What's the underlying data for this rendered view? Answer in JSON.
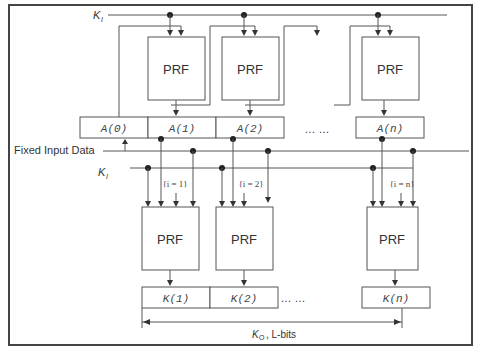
{
  "diagram": {
    "labels": {
      "ki_top": "K",
      "ki_top_sub": "I",
      "ki_mid": "K",
      "ki_mid_sub": "I",
      "fixed_input": "Fixed Input Data",
      "ko": "K",
      "ko_sub": "O",
      "ko_rest": ", L-bits",
      "ellipsis_a": "… …",
      "ellipsis_k": "… …"
    },
    "top_prf": [
      {
        "label": "PRF"
      },
      {
        "label": "PRF"
      },
      {
        "label": "PRF"
      }
    ],
    "a_registers": [
      {
        "label": "A(0)"
      },
      {
        "label": "A(1)"
      },
      {
        "label": "A(2)"
      },
      {
        "label": "A(n)"
      }
    ],
    "counters": [
      {
        "label": "{i = 1}"
      },
      {
        "label": "{i = 2}"
      },
      {
        "label": "{i = n}"
      }
    ],
    "bottom_prf": [
      {
        "label": "PRF"
      },
      {
        "label": "PRF"
      },
      {
        "label": "PRF"
      }
    ],
    "k_outputs": [
      {
        "label": "K(1)"
      },
      {
        "label": "K(2)"
      },
      {
        "label": "K(n)"
      }
    ]
  }
}
